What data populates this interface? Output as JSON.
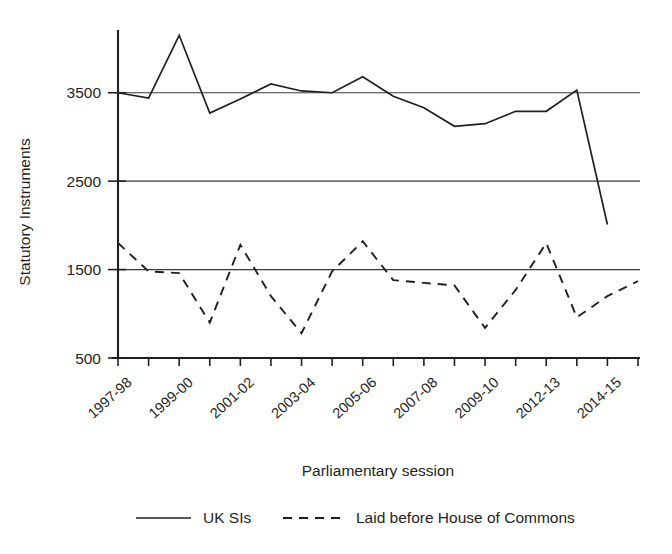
{
  "chart_data": {
    "type": "line",
    "title": "",
    "xlabel": "Parliamentary session",
    "ylabel": "Statutory Instruments",
    "ylim": [
      500,
      4300
    ],
    "yticks": [
      500,
      1500,
      2500,
      3500
    ],
    "ytick_labels": [
      "500",
      "1500",
      "2500",
      "3500"
    ],
    "grid": "horizontal gridlines at 1500, 2500, 3500",
    "legend_position": "below-axis-centered",
    "categories": [
      "1997-98",
      "1998-99",
      "1999-00",
      "2000-01",
      "2001-02",
      "2002-03",
      "2003-04",
      "2004-05",
      "2005-06",
      "2006-07",
      "2007-08",
      "2008-09",
      "2009-10",
      "2010-12",
      "2012-13",
      "2013-14",
      "2014-15",
      "2015-16"
    ],
    "xtick_labels_visible": [
      "1997-98",
      "1999-00",
      "2001-02",
      "2003-04",
      "2005-06",
      "2007-08",
      "2009-10",
      "2012-13",
      "2014-15"
    ],
    "xtick_label_indices": [
      0,
      2,
      4,
      6,
      8,
      10,
      12,
      14,
      16
    ],
    "series": [
      {
        "name": "UK SIs",
        "style": "solid",
        "color": "#231f20",
        "values": [
          3500,
          3440,
          4150,
          3270,
          3430,
          3600,
          3520,
          3500,
          3680,
          3460,
          3330,
          3120,
          3150,
          3290,
          3290,
          3530,
          2010,
          null
        ]
      },
      {
        "name": "Laid before House of Commons",
        "style": "dashed",
        "color": "#231f20",
        "values": [
          1800,
          1480,
          1460,
          900,
          1780,
          1200,
          780,
          1480,
          1820,
          1380,
          1350,
          1320,
          840,
          1270,
          1800,
          960,
          1200,
          1370
        ]
      }
    ]
  },
  "legend": {
    "items": [
      {
        "label": "UK SIs",
        "style": "solid"
      },
      {
        "label": "Laid before House of Commons",
        "style": "dashed"
      }
    ]
  },
  "axes": {
    "y_title": "Statutory Instruments",
    "x_title": "Parliamentary session"
  }
}
